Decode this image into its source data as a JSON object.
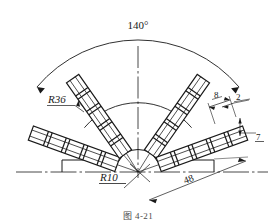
{
  "figure": {
    "type": "engineering-drawing",
    "caption": "图 4-21"
  },
  "dimensions": {
    "total_angle": "140°",
    "outer_radius": "R36",
    "inner_radius": "R10",
    "arm_length": "48",
    "segment_pitch": "8",
    "link_width": "2",
    "strip_thickness": "7"
  },
  "labels": {
    "angle_140": "140°",
    "radius_36": "R36",
    "radius_10": "R10",
    "length_48": "48",
    "pitch_8": "8",
    "width_2": "2",
    "thickness_7": "7"
  },
  "geometry": {
    "hub_center_x": 138,
    "hub_center_y": 172,
    "arc_outer_radius": 132,
    "arc_r36_radius": 70,
    "arc_r10_radius": 22,
    "arm_angles_deg": [
      160,
      125,
      55,
      20
    ],
    "arm_count": 4
  },
  "colors": {
    "line": "#1a1a1a",
    "thin_line": "#2b2b2b",
    "background": "#ffffff",
    "caption_text": "#4a4a4a"
  }
}
